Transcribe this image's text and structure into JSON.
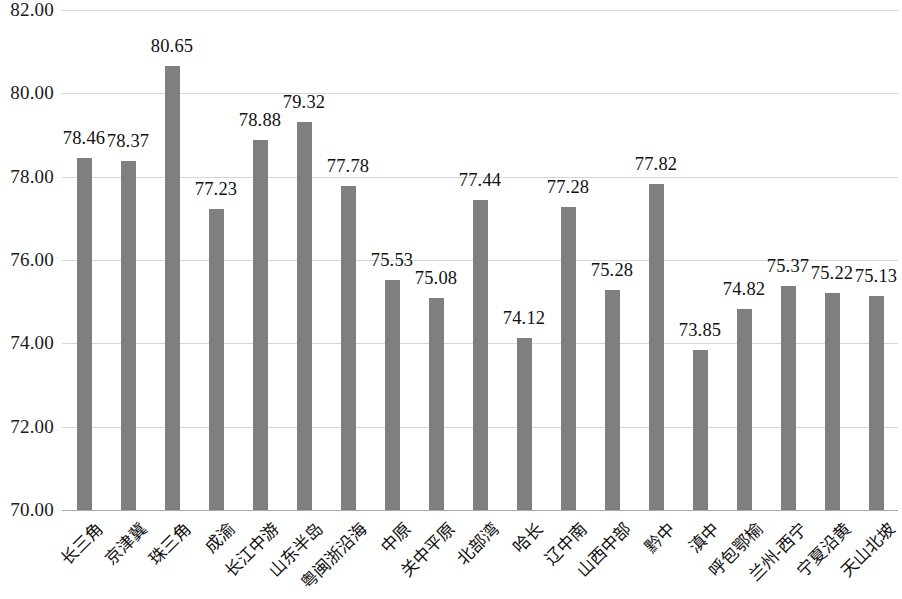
{
  "chart_data": {
    "type": "bar",
    "title": "",
    "subtitle": "",
    "xlabel": "",
    "ylabel": "",
    "ylim": [
      70.0,
      82.0
    ],
    "ytick_step": 2.0,
    "ytick_labels": [
      "82.00",
      "80.00",
      "78.00",
      "76.00",
      "74.00",
      "72.00",
      "70.00"
    ],
    "ytick_values": [
      82.0,
      80.0,
      78.0,
      76.0,
      74.0,
      72.0,
      70.0
    ],
    "grid": true,
    "legend": false,
    "legend_position": "none",
    "bar_color": "#7f7f7f",
    "gridline_color": "#d6d6d6",
    "value_label_format": "0.00",
    "x_label_rotation": -45,
    "categories": [
      "长三角",
      "京津冀",
      "珠三角",
      "成渝",
      "长江中游",
      "山东半岛",
      "粤闽浙沿海",
      "中原",
      "关中平原",
      "北部湾",
      "哈长",
      "辽中南",
      "山西中部",
      "黔中",
      "滇中",
      "呼包鄂榆",
      "兰州-西宁",
      "宁夏沿黄",
      "天山北坡"
    ],
    "values": [
      78.46,
      78.37,
      80.65,
      77.23,
      78.88,
      79.32,
      77.78,
      75.53,
      75.08,
      77.44,
      74.12,
      77.28,
      75.28,
      77.82,
      73.85,
      74.82,
      75.37,
      75.22,
      75.13
    ],
    "value_labels": [
      "78.46",
      "78.37",
      "80.65",
      "77.23",
      "78.88",
      "79.32",
      "77.78",
      "75.53",
      "75.08",
      "77.44",
      "74.12",
      "77.28",
      "75.28",
      "77.82",
      "73.85",
      "74.82",
      "75.37",
      "75.22",
      "75.13"
    ]
  }
}
